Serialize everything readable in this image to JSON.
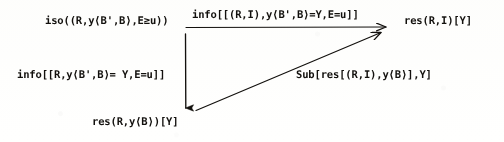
{
  "diagram": {
    "kind": "commutative-diagram",
    "title": "",
    "ink_color": "#14120f",
    "paper_color": "#fdfdfc",
    "nodes": [
      {
        "id": "iso",
        "label": "iso((R,y⟨B',B⟩,E≥u))",
        "position": "top-left"
      },
      {
        "id": "res-ri",
        "label": "res(R,I)[Y]",
        "position": "top-right"
      },
      {
        "id": "res-ryb",
        "label": "res(R,y⟨B⟩)[Y]",
        "position": "bottom-left"
      }
    ],
    "edges": [
      {
        "id": "top",
        "from": "iso",
        "to": "res-ri",
        "label": "info[[(R,I),y⟨B',B⟩=Y,E=u]]",
        "direction": "horizontal-right",
        "has_rule_under_label": true
      },
      {
        "id": "left",
        "from": "iso",
        "to": "res-ryb",
        "label": "info[[R,y⟨B',B⟩= Y,E=u]]",
        "direction": "vertical-down",
        "has_rule_under_label": false
      },
      {
        "id": "diagonal",
        "from": "res-ryb",
        "to": "res-ri",
        "label": "Sub[res[(R,I),y⟨B⟩],Y]",
        "direction": "diagonal-up-right",
        "has_rule_under_label": false
      }
    ]
  }
}
